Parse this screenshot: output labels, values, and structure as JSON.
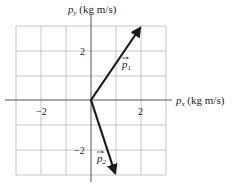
{
  "diagram": {
    "x_axis": {
      "label_var": "p",
      "label_sub": "x",
      "label_unit": " (kg m/s)",
      "ticks": [
        {
          "value": -2,
          "label": "−2"
        },
        {
          "value": 2,
          "label": "2"
        }
      ]
    },
    "y_axis": {
      "label_var": "p",
      "label_sub": "y",
      "label_unit": " (kg m/s)",
      "ticks": [
        {
          "value": 2,
          "label": "2"
        },
        {
          "value": -2,
          "label": "−2"
        }
      ]
    },
    "grid": {
      "xmin": -3,
      "xmax": 3,
      "ymin": -3,
      "ymax": 3,
      "step": 1,
      "color": "#b8b8b8"
    },
    "vectors": [
      {
        "name": "p1",
        "label_var": "p",
        "label_sub": "1",
        "from": [
          0,
          0
        ],
        "to": [
          2,
          3
        ],
        "color": "#1a1a1a"
      },
      {
        "name": "p2",
        "label_var": "p",
        "label_sub": "2",
        "from": [
          0,
          0
        ],
        "to": [
          1,
          -3
        ],
        "color": "#1a1a1a"
      }
    ]
  }
}
